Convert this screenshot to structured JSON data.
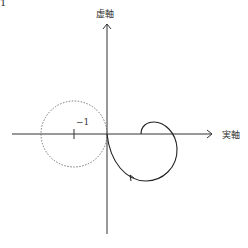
{
  "figure_label": "1",
  "axes": {
    "imag_label": "虚軸",
    "real_label": "実軸",
    "tick_label": "−1"
  },
  "colors": {
    "axis": "#333333",
    "curve": "#222222",
    "circle": "#666666"
  }
}
